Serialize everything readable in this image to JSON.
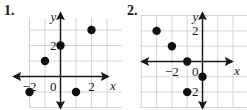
{
  "graphs": [
    {
      "number": "1.",
      "number_pos": [
        4,
        4
      ],
      "origin_px": [
        60.5,
        76.5
      ],
      "unit_px": 15.5,
      "grid_x_range": [
        -2,
        3
      ],
      "grid_y_range": [
        -2,
        4
      ],
      "grid_extent_px": {
        "x0": 30,
        "x1": 122,
        "y0": 18,
        "y1": 108
      },
      "x_axis_px": [
        14,
        108
      ],
      "y_axis_px": [
        13,
        108
      ],
      "axis_labels": {
        "x": "x",
        "y": "y"
      },
      "tick_labels": [
        {
          "axis": "x",
          "value": -2,
          "text": "−2"
        },
        {
          "axis": "x",
          "value": 2,
          "text": "2"
        },
        {
          "axis": "y",
          "value": 2,
          "text": "2"
        },
        {
          "axis": "origin",
          "value": 0,
          "text": "0"
        }
      ],
      "points": [
        {
          "x": 2,
          "y": 3
        },
        {
          "x": 0,
          "y": 2
        },
        {
          "x": -1,
          "y": 1
        },
        {
          "x": -2,
          "y": -1
        },
        {
          "x": 1,
          "y": -1
        }
      ]
    },
    {
      "number": "2.",
      "number_pos": [
        127,
        4
      ],
      "origin_px": [
        202.5,
        61.5
      ],
      "unit_px": 15.3,
      "grid_x_range": [
        -4,
        2
      ],
      "grid_y_range": [
        -3,
        3
      ],
      "grid_extent_px": {
        "x0": 140,
        "x1": 247,
        "y0": 16,
        "y1": 108
      },
      "x_axis_px": [
        142,
        232
      ],
      "y_axis_px": [
        13,
        108
      ],
      "axis_labels": {
        "x": "x",
        "y": "y"
      },
      "tick_labels": [
        {
          "axis": "x",
          "value": -2,
          "text": "−2"
        },
        {
          "axis": "y",
          "value": 2,
          "text": "2"
        },
        {
          "axis": "y",
          "value": -2,
          "text": "−2"
        },
        {
          "axis": "origin",
          "value": 0,
          "text": "0"
        }
      ],
      "points": [
        {
          "x": -3,
          "y": 2
        },
        {
          "x": -2,
          "y": 1
        },
        {
          "x": -1,
          "y": 0
        },
        {
          "x": 0,
          "y": -1
        },
        {
          "x": -1,
          "y": -2
        }
      ]
    }
  ],
  "colors": {
    "grid": "#d4d4d4",
    "ink": "#1a1a1a",
    "point": "#111111"
  }
}
